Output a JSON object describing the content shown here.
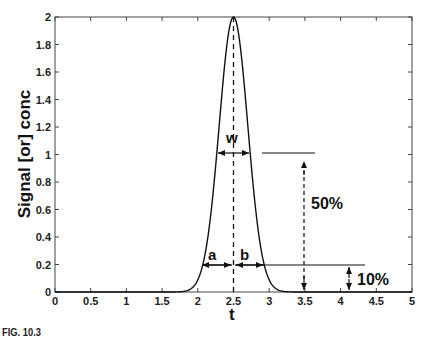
{
  "chart_data": {
    "type": "line",
    "title": "",
    "xlabel": "t",
    "ylabel": "Signal [or] conc",
    "xlim": [
      0,
      5
    ],
    "ylim": [
      0,
      2
    ],
    "xticks": [
      "0",
      "0.5",
      "1",
      "1.5",
      "2",
      "2.5",
      "3",
      "3.5",
      "4",
      "4.5",
      "5"
    ],
    "yticks": [
      "0",
      "0.2",
      "0.4",
      "0.6",
      "0.8",
      "1",
      "1.2",
      "1.4",
      "1.6",
      "1.8",
      "2"
    ],
    "grid": false,
    "series": [
      {
        "name": "Gaussian peak",
        "description": "Gaussian peak centered at t=2.5 with height 2",
        "center": 2.5,
        "peak": 2,
        "sigma": 0.2
      }
    ],
    "annotations": [
      {
        "text": "w",
        "type": "width-at-half-height",
        "y": 1.0
      },
      {
        "text": "a",
        "type": "left-half-width-at-10%",
        "y": 0.2
      },
      {
        "text": "b",
        "type": "right-half-width-at-10%",
        "y": 0.2
      },
      {
        "text": "50%",
        "type": "vertical-dimension"
      },
      {
        "text": "10%",
        "type": "vertical-dimension"
      }
    ],
    "vertical_dashed_line_at": 2.5
  },
  "labels": {
    "xlabel": "t",
    "ylabel": "Signal [or] conc",
    "w": "w",
    "a": "a",
    "b": "b",
    "pct50": "50%",
    "pct10": "10%",
    "caption": "FIG. 10.3"
  },
  "xticks": [
    "0",
    "0.5",
    "1",
    "1.5",
    "2",
    "2.5",
    "3",
    "3.5",
    "4",
    "4.5",
    "5"
  ],
  "yticks": [
    "0",
    "0.2",
    "0.4",
    "0.6",
    "0.8",
    "1",
    "1.2",
    "1.4",
    "1.6",
    "1.8",
    "2"
  ]
}
